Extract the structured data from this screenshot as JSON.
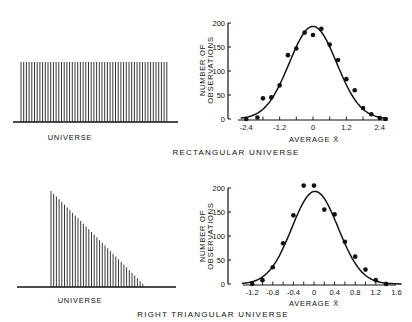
{
  "panels": [
    {
      "universe_label": "UNIVERSE",
      "caption": "RECTANGULAR UNIVERSE",
      "universe_shape": "rectangular"
    },
    {
      "universe_label": "UNIVERSE",
      "caption": "RIGHT TRIANGULAR UNIVERSE",
      "universe_shape": "right-triangular"
    }
  ],
  "axis_labels": {
    "y_line1": "NUMBER OF",
    "y_line2": "OBSERVATIONS",
    "x": "AVERAGE X̄"
  },
  "chart_data": [
    {
      "type": "scatter",
      "title": "RECTANGULAR UNIVERSE",
      "xlabel": "AVERAGE X̄",
      "ylabel": "NUMBER OF OBSERVATIONS",
      "xlim": [
        -2.6,
        2.7
      ],
      "ylim": [
        0,
        200
      ],
      "x_ticks": [
        -2.4,
        -1.2,
        0,
        1.2,
        2.4
      ],
      "y_ticks": [
        0,
        50,
        100,
        150,
        200
      ],
      "grid": false,
      "series": [
        {
          "name": "observed",
          "x": [
            -2.4,
            -2.0,
            -1.8,
            -1.5,
            -1.2,
            -0.9,
            -0.6,
            -0.3,
            0.0,
            0.3,
            0.6,
            0.9,
            1.2,
            1.5,
            1.8,
            2.1,
            2.4,
            2.6
          ],
          "y": [
            0,
            3,
            43,
            45,
            70,
            133,
            147,
            180,
            175,
            188,
            155,
            123,
            83,
            60,
            23,
            10,
            2,
            0
          ]
        },
        {
          "name": "normal curve",
          "curve": "gaussian",
          "mean": 0,
          "peak": 193,
          "sd": 0.85
        }
      ]
    },
    {
      "type": "scatter",
      "title": "RIGHT TRIANGULAR UNIVERSE",
      "xlabel": "AVERAGE X̄",
      "ylabel": "NUMBER OF OBSERVATIONS",
      "xlim": [
        -1.4,
        1.7
      ],
      "ylim": [
        0,
        200
      ],
      "x_ticks": [
        -1.2,
        -0.8,
        -0.4,
        0,
        0.4,
        0.8,
        1.2,
        1.6
      ],
      "y_ticks": [
        0,
        50,
        100,
        150,
        200
      ],
      "grid": false,
      "series": [
        {
          "name": "observed",
          "x": [
            -1.2,
            -1.0,
            -0.8,
            -0.6,
            -0.4,
            -0.2,
            0.0,
            0.2,
            0.4,
            0.6,
            0.8,
            1.0,
            1.2,
            1.4
          ],
          "y": [
            0,
            8,
            35,
            85,
            143,
            205,
            205,
            155,
            145,
            88,
            57,
            30,
            8,
            0
          ]
        },
        {
          "name": "normal curve",
          "curve": "gaussian",
          "mean": 0.02,
          "peak": 193,
          "sd": 0.45
        }
      ]
    }
  ]
}
